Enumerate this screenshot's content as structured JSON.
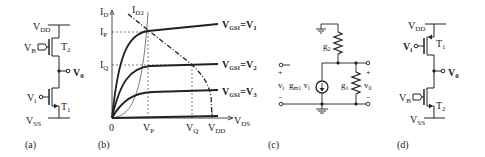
{
  "panels": {
    "a": {
      "label": "(a)",
      "vdd": "V",
      "vdd_sub": "DD",
      "vss": "V",
      "vss_sub": "SS",
      "vb": "V",
      "vb_sub": "B",
      "vi": "V",
      "vi_sub": "i",
      "vo": "V",
      "vo_sub": "0",
      "t_top": "T",
      "t_top_sub": "2",
      "t_bot": "T",
      "t_bot_sub": "1"
    },
    "b": {
      "label": "(b)",
      "y_axis": "I",
      "y_axis_sub": "D",
      "x_axis": "V",
      "x_axis_sub": "DS",
      "origin": "0",
      "id2": "I",
      "id2_sub": "D2",
      "ip": "I",
      "ip_sub": "P",
      "iq": "I",
      "iq_sub": "Q",
      "vp": "V",
      "vp_sub": "P",
      "vq": "V",
      "vq_sub": "Q",
      "vdd": "V",
      "vdd_sub": "DD",
      "curves": [
        {
          "lhs": "V",
          "lhs_sub": "GS1",
          "rhs": "=V",
          "rhs_sub": "1"
        },
        {
          "lhs": "V",
          "lhs_sub": "GS1",
          "rhs": "=V",
          "rhs_sub": "2"
        },
        {
          "lhs": "V",
          "lhs_sub": "GS1",
          "rhs": "=V",
          "rhs_sub": "3"
        }
      ]
    },
    "c": {
      "label": "(c)",
      "g2": "g",
      "g2_sub": "2",
      "g1": "g",
      "g1_sub": "1",
      "vi": "v",
      "vi_sub": "i",
      "gm": "g",
      "gm_sub": "m1",
      "gm_v": " v",
      "gm_v_sub": "i",
      "vo": "v",
      "vo_sub": "0",
      "plus": "+",
      "minus": "−"
    },
    "d": {
      "label": "(d)",
      "vdd": "V",
      "vdd_sub": "DD",
      "vss": "V",
      "vss_sub": "SS",
      "vb": "V",
      "vb_sub": "B",
      "vi": "V",
      "vi_sub": "i",
      "vo": "V",
      "vo_sub": "0",
      "t_top": "T",
      "t_top_sub": "1",
      "t_bot": "T",
      "t_bot_sub": "2"
    }
  }
}
